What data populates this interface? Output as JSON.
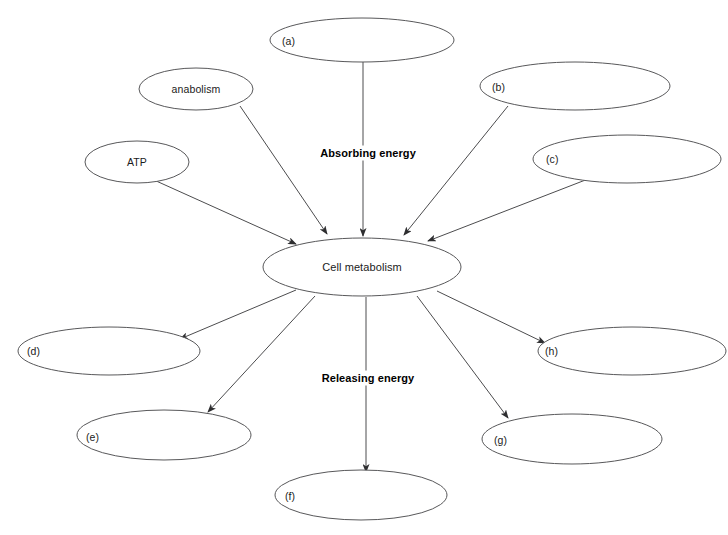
{
  "diagram": {
    "background_color": "#ffffff",
    "node_stroke_color": "#58585a",
    "edge_color": "#4c4c4e",
    "text_color": "#1b1b1b",
    "center_node": {
      "id": "cell-metabolism",
      "label": "Cell metabolism",
      "cx": 362,
      "cy": 267,
      "rx": 99,
      "ry": 29
    },
    "flow_labels": [
      {
        "id": "absorbing-energy",
        "label": "Absorbing energy",
        "x": 368,
        "y": 153
      },
      {
        "id": "releasing-energy",
        "label": "Releasing energy",
        "x": 368,
        "y": 378
      }
    ],
    "input_nodes": [
      {
        "id": "node-a",
        "label": "(a)",
        "label_align": "left",
        "cx": 362,
        "cy": 40,
        "rx": 92,
        "ry": 22,
        "label_x": 282,
        "label_y": 41
      },
      {
        "id": "node-anabolism",
        "label": "anabolism",
        "label_align": "center",
        "cx": 196,
        "cy": 89,
        "rx": 57,
        "ry": 21,
        "label_x": 196,
        "label_y": 89
      },
      {
        "id": "node-b",
        "label": "(b)",
        "label_align": "left",
        "cx": 575,
        "cy": 86,
        "rx": 95,
        "ry": 24,
        "label_x": 492,
        "label_y": 87
      },
      {
        "id": "node-atp",
        "label": "ATP",
        "label_align": "center",
        "cx": 137,
        "cy": 162,
        "rx": 52,
        "ry": 21,
        "label_x": 137,
        "label_y": 162
      },
      {
        "id": "node-c",
        "label": "(c)",
        "label_align": "left",
        "cx": 627,
        "cy": 159,
        "rx": 94,
        "ry": 24,
        "label_x": 546,
        "label_y": 159
      }
    ],
    "output_nodes": [
      {
        "id": "node-d",
        "label": "(d)",
        "label_align": "left",
        "cx": 109,
        "cy": 351,
        "rx": 91,
        "ry": 24,
        "label_x": 27,
        "label_y": 351
      },
      {
        "id": "node-e",
        "label": "(e)",
        "label_align": "left",
        "cx": 164,
        "cy": 435,
        "rx": 87,
        "ry": 25,
        "label_x": 86,
        "label_y": 437
      },
      {
        "id": "node-f",
        "label": "(f)",
        "label_align": "left",
        "cx": 361,
        "cy": 495,
        "rx": 86,
        "ry": 25,
        "label_x": 285,
        "label_y": 496
      },
      {
        "id": "node-g",
        "label": "(g)",
        "label_align": "left",
        "cx": 572,
        "cy": 439,
        "rx": 90,
        "ry": 25,
        "label_x": 494,
        "label_y": 440
      },
      {
        "id": "node-h",
        "label": "(h)",
        "label_align": "left",
        "cx": 632,
        "cy": 351,
        "rx": 94,
        "ry": 24,
        "label_x": 545,
        "label_y": 351
      }
    ],
    "edges": [
      {
        "id": "edge-a-to-center",
        "from": "node-a",
        "to": "cell-metabolism",
        "direction": "in",
        "x1": 363,
        "y1": 62,
        "x2": 363,
        "y2": 236
      },
      {
        "id": "edge-anabolism-to-center",
        "from": "node-anabolism",
        "to": "cell-metabolism",
        "direction": "in",
        "x1": 240,
        "y1": 106,
        "x2": 327,
        "y2": 234
      },
      {
        "id": "edge-b-to-center",
        "from": "node-b",
        "to": "cell-metabolism",
        "direction": "in",
        "x1": 508,
        "y1": 106,
        "x2": 404,
        "y2": 235
      },
      {
        "id": "edge-atp-to-center",
        "from": "node-atp",
        "to": "cell-metabolism",
        "direction": "in",
        "x1": 154,
        "y1": 180,
        "x2": 296,
        "y2": 244
      },
      {
        "id": "edge-c-to-center",
        "from": "node-c",
        "to": "cell-metabolism",
        "direction": "in",
        "x1": 588,
        "y1": 179,
        "x2": 428,
        "y2": 241
      },
      {
        "id": "edge-center-to-d",
        "from": "cell-metabolism",
        "to": "node-d",
        "direction": "out",
        "x1": 296,
        "y1": 290,
        "x2": 180,
        "y2": 339
      },
      {
        "id": "edge-center-to-e",
        "from": "cell-metabolism",
        "to": "node-e",
        "direction": "out",
        "x1": 315,
        "y1": 296,
        "x2": 208,
        "y2": 412
      },
      {
        "id": "edge-center-to-f",
        "from": "cell-metabolism",
        "to": "node-f",
        "direction": "out",
        "x1": 366,
        "y1": 297,
        "x2": 366,
        "y2": 472
      },
      {
        "id": "edge-center-to-g",
        "from": "cell-metabolism",
        "to": "node-g",
        "direction": "out",
        "x1": 417,
        "y1": 296,
        "x2": 508,
        "y2": 418
      },
      {
        "id": "edge-center-to-h",
        "from": "cell-metabolism",
        "to": "node-h",
        "direction": "out",
        "x1": 437,
        "y1": 291,
        "x2": 545,
        "y2": 343
      }
    ]
  }
}
